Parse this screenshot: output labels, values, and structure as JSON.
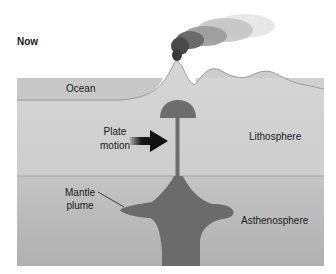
{
  "diagram": {
    "title": "Now",
    "labels": {
      "ocean": "Ocean",
      "plate_motion_line1": "Plate",
      "plate_motion_line2": "motion",
      "lithosphere": "Lithosphere",
      "mantle_plume_line1": "Mantle",
      "mantle_plume_line2": "plume",
      "asthenosphere": "Asthenosphere"
    },
    "colors": {
      "background": "#ffffff",
      "ocean": "#c9c9c9",
      "lithosphere": "#d3d3d3",
      "asthenosphere": "#bdbdbd",
      "plume": "#6e6e6e",
      "smoke": "#8a8a8a",
      "arrow": "#1a1a1a",
      "text": "#1a1a1a"
    }
  }
}
